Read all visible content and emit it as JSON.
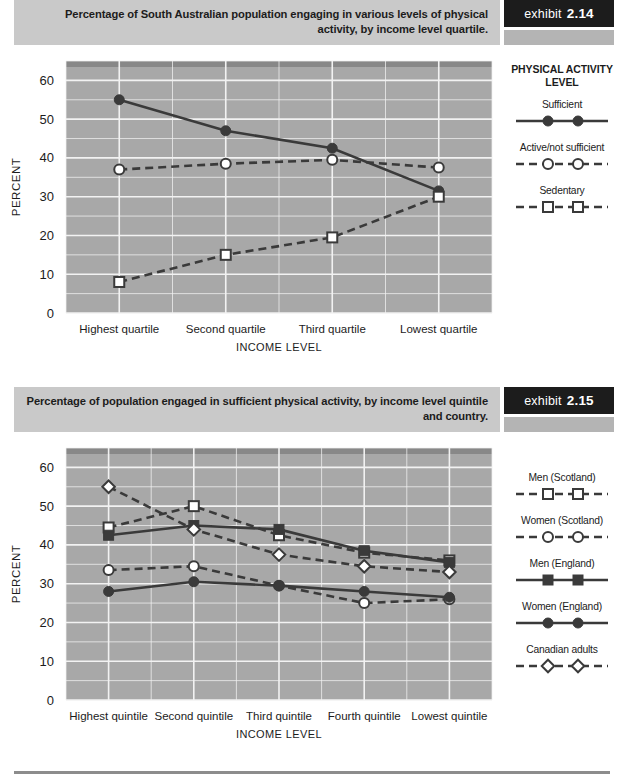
{
  "page": {
    "background": "#ffffff",
    "footer_rule_color": "#8c8c8c"
  },
  "palette": {
    "header_bar": "#c9c9c9",
    "badge_bg": "#1c1c1c",
    "badge_text": "#ffffff",
    "badge_under": "#b4b4b4",
    "plot_bg": "#a8a8a8",
    "plot_top_band": "#7d7d7d",
    "gridline": "#f2f2f2",
    "series_dark": "#3a3a3a",
    "axis_text": "#1c1c1c"
  },
  "exhibits": [
    {
      "id": "exhibit-2-14",
      "badge": {
        "word": "exhibit",
        "number": "2.14"
      },
      "title": "Percentage of South Australian population engaging in various levels of physical activity, by income level quartile.",
      "legend": {
        "title": "PHYSICAL ACTIVITY LEVEL",
        "items": [
          {
            "label": "Sufficient",
            "marker": "filled-circle",
            "line": "solid"
          },
          {
            "label": "Active/not sufficient",
            "marker": "open-circle",
            "line": "dashed"
          },
          {
            "label": "Sedentary",
            "marker": "open-square",
            "line": "dashed"
          }
        ]
      },
      "chart_data": {
        "type": "line",
        "title": "Percentage of South Australian population engaging in various levels of physical activity, by income level quartile.",
        "xlabel": "INCOME LEVEL",
        "ylabel": "PERCENT",
        "categories": [
          "Highest quartile",
          "Second quartile",
          "Third quartile",
          "Lowest quartile"
        ],
        "ylim": [
          0,
          65
        ],
        "yticks": [
          0,
          10,
          20,
          30,
          40,
          50,
          60
        ],
        "grid": true,
        "legend_position": "right",
        "series": [
          {
            "name": "Sufficient",
            "marker": "filled-circle",
            "line": "solid",
            "values": [
              55,
              47,
              42.5,
              31.5
            ]
          },
          {
            "name": "Active/not sufficient",
            "marker": "open-circle",
            "line": "dashed",
            "values": [
              37,
              38.5,
              39.5,
              37.5
            ]
          },
          {
            "name": "Sedentary",
            "marker": "open-square",
            "line": "dashed",
            "values": [
              8,
              15,
              19.5,
              30
            ]
          }
        ]
      }
    },
    {
      "id": "exhibit-2-15",
      "badge": {
        "word": "exhibit",
        "number": "2.15"
      },
      "title": "Percentage of population engaged in sufficient physical activity, by income level quintile and country.",
      "legend": {
        "title": "",
        "items": [
          {
            "label": "Men (Scotland)",
            "marker": "open-square",
            "line": "dashed"
          },
          {
            "label": "Women (Scotland)",
            "marker": "open-circle",
            "line": "dashed"
          },
          {
            "label": "Men (England)",
            "marker": "filled-square",
            "line": "solid"
          },
          {
            "label": "Women (England)",
            "marker": "filled-circle",
            "line": "solid"
          },
          {
            "label": "Canadian adults",
            "marker": "open-diamond",
            "line": "dashed"
          }
        ]
      },
      "chart_data": {
        "type": "line",
        "title": "Percentage of population engaged in sufficient physical activity, by income level quintile and country.",
        "xlabel": "INCOME LEVEL",
        "ylabel": "PERCENT",
        "categories": [
          "Highest quintile",
          "Second quintile",
          "Third quintile",
          "Fourth quintile",
          "Lowest quintile"
        ],
        "ylim": [
          0,
          65
        ],
        "yticks": [
          0,
          10,
          20,
          30,
          40,
          50,
          60
        ],
        "grid": true,
        "legend_position": "right",
        "series": [
          {
            "name": "Men (Scotland)",
            "marker": "open-square",
            "line": "dashed",
            "values": [
              44.5,
              50,
              42.5,
              38,
              36
            ]
          },
          {
            "name": "Women (Scotland)",
            "marker": "open-circle",
            "line": "dashed",
            "values": [
              33.5,
              34.5,
              29.5,
              25,
              26
            ]
          },
          {
            "name": "Men (England)",
            "marker": "filled-square",
            "line": "solid",
            "values": [
              42.5,
              45,
              44,
              38.5,
              35.5
            ]
          },
          {
            "name": "Women (England)",
            "marker": "filled-circle",
            "line": "solid",
            "values": [
              28,
              30.5,
              29.5,
              28,
              26.5
            ]
          },
          {
            "name": "Canadian adults",
            "marker": "open-diamond",
            "line": "dashed",
            "values": [
              55,
              44,
              37.5,
              34.5,
              33
            ]
          }
        ]
      }
    }
  ]
}
